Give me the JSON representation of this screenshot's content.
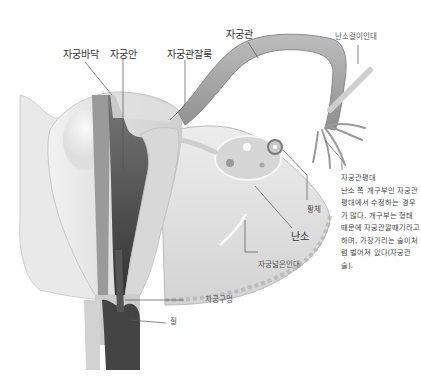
{
  "figure": {
    "style": "grayscale anatomical illustration"
  },
  "labels": {
    "fundus": "자궁바닥",
    "cavity": "자궁안",
    "isthmus": "자궁관잘룩",
    "fallopian_tube": "자궁관",
    "suspensory_ligament": "난소걸이인대",
    "fimbriae": "자궁관평대",
    "corpus_luteum": "황체",
    "ovary": "난소",
    "broad_ligament": "자궁넓은인대",
    "os": "자궁구멍",
    "vagina": "질"
  },
  "description": {
    "title": "자궁관평대",
    "body": "난소 쪽 개구부인 자궁관평대에서 수정하는 경우가 많다. 개구부는 형태 때문에 자궁관깔때기라고 하며, 가장가리는 술이처럼 벌어져 있다(자궁관술)."
  },
  "colors": {
    "background": "#ffffff",
    "leader_line": "#555555",
    "text": "#333333",
    "tissue_light": "#e6e6e6",
    "tissue_mid": "#c4c4c4",
    "tissue_dark": "#555555"
  }
}
